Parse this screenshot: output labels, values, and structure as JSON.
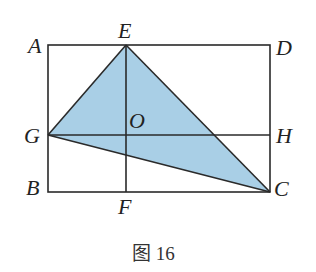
{
  "figure": {
    "caption": "图 16",
    "fill_color": "#a9cfe6",
    "line_color": "#2a2a2a"
  },
  "points": {
    "A": "A",
    "B": "B",
    "C": "C",
    "D": "D",
    "E": "E",
    "F": "F",
    "G": "G",
    "H": "H",
    "O": "O"
  },
  "shapes": {
    "rectangle": "ABCD",
    "shaded_triangle": "EGC",
    "segments": [
      "EF",
      "GH"
    ]
  }
}
